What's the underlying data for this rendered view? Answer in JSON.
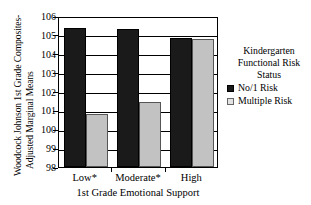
{
  "chart_data": {
    "type": "bar",
    "title": "",
    "categories": [
      "Low*",
      "Moderate*",
      "High"
    ],
    "series": [
      {
        "name": "No/1 Risk",
        "color": "#1a1a1a",
        "values": [
          105.35,
          105.3,
          104.85
        ]
      },
      {
        "name": "Multiple Risk",
        "color": "#c2c2c2",
        "values": [
          100.8,
          101.45,
          104.8
        ]
      }
    ],
    "xlabel": "1st Grade Emotional Support",
    "ylabel": "Woodcock Johnson 1st Grade Composites- Adjusted Marginal Means",
    "ylabel_lines": [
      "Woodcock Johnson 1st Grade Composites-",
      "Adjusted Marginal Means"
    ],
    "ylim": [
      98,
      106
    ],
    "yticks": [
      106,
      105,
      104,
      103,
      102,
      101,
      100,
      99,
      98
    ],
    "ytick_labels": [
      "106",
      "105",
      "104",
      "103",
      "102",
      "101",
      "100",
      "99",
      "98"
    ],
    "grid": true,
    "legend_position": "right",
    "legend": {
      "title_lines": [
        "Kindergarten",
        "Functional Risk",
        "Status"
      ],
      "entries": [
        {
          "label": "No/1 Risk",
          "swatch": "dark"
        },
        {
          "label": "Multiple Risk",
          "swatch": "light"
        }
      ]
    }
  }
}
